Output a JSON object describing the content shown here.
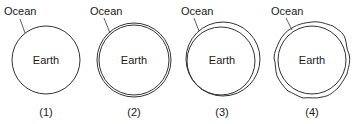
{
  "diagrams": [
    {
      "index": "(1)",
      "ocean_label": "Ocean",
      "center_label": "Earth",
      "style": "single line (no ocean layer)"
    },
    {
      "index": "(2)",
      "ocean_label": "Ocean",
      "center_label": "Earth",
      "style": "thin uniform ocean layer"
    },
    {
      "index": "(3)",
      "ocean_label": "Ocean",
      "center_label": "Earth",
      "style": "uneven ocean layer, thicker at one side"
    },
    {
      "index": "(4)",
      "ocean_label": "Ocean",
      "center_label": "Earth",
      "style": "irregular, bumpy ocean surface"
    }
  ],
  "colors": {
    "stroke": "#333333",
    "text": "#1a1a1a",
    "background": "#ffffff"
  }
}
